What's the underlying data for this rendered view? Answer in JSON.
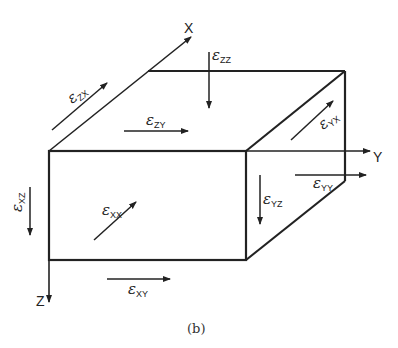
{
  "diagram": {
    "type": "strain-component-cube",
    "caption": "(b)",
    "axes": {
      "x": "X",
      "y": "Y",
      "z": "Z"
    },
    "strain_symbol": "ε",
    "components": [
      {
        "id": "zx",
        "symbol": "ε",
        "subscript": "ZX",
        "face": "top",
        "direction": "along X (diagonal)"
      },
      {
        "id": "zy",
        "symbol": "ε",
        "subscript": "ZY",
        "face": "top",
        "direction": "along Y"
      },
      {
        "id": "zz",
        "symbol": "ε",
        "subscript": "ZZ",
        "face": "top",
        "direction": "along Z (down)"
      },
      {
        "id": "yx",
        "symbol": "ε",
        "subscript": "YX",
        "face": "right",
        "direction": "along X (diagonal)"
      },
      {
        "id": "yy",
        "symbol": "ε",
        "subscript": "YY",
        "face": "right",
        "direction": "along Y"
      },
      {
        "id": "yz",
        "symbol": "ε",
        "subscript": "YZ",
        "face": "right",
        "direction": "along Z (down)"
      },
      {
        "id": "xx",
        "symbol": "ε",
        "subscript": "XX",
        "face": "front",
        "direction": "along X (diagonal)"
      },
      {
        "id": "xy",
        "symbol": "ε",
        "subscript": "XY",
        "face": "front",
        "direction": "along Y"
      },
      {
        "id": "xz",
        "symbol": "ε",
        "subscript": "XZ",
        "face": "front",
        "direction": "along Z (down)",
        "rendered_rotated": true
      }
    ],
    "colors": {
      "line": "#222222",
      "background": "#ffffff"
    }
  }
}
